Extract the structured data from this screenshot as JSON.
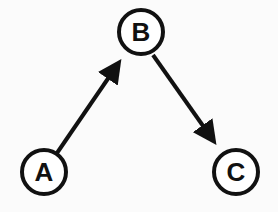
{
  "diagram": {
    "type": "directed-graph",
    "colors": {
      "background": "#fbfbfb",
      "stroke": "#111111"
    },
    "nodes": [
      {
        "id": "A",
        "label": "A",
        "cx": 44,
        "cy": 172
      },
      {
        "id": "B",
        "label": "B",
        "cx": 141,
        "cy": 32
      },
      {
        "id": "C",
        "label": "C",
        "cx": 236,
        "cy": 172
      }
    ],
    "edges": [
      {
        "from": "A",
        "to": "B"
      },
      {
        "from": "B",
        "to": "C"
      }
    ]
  }
}
